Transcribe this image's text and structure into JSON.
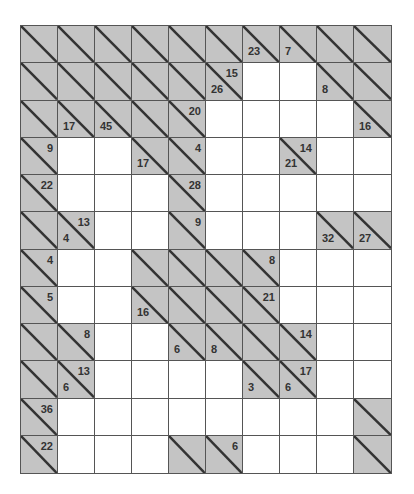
{
  "puzzle": {
    "type": "kakuro",
    "cols": 10,
    "rows": 12,
    "colors": {
      "block": "#c4c4c4",
      "white": "#ffffff",
      "line": "#555555",
      "text": "#333333"
    },
    "grid": [
      [
        {
          "t": "b"
        },
        {
          "t": "b"
        },
        {
          "t": "b"
        },
        {
          "t": "b"
        },
        {
          "t": "b"
        },
        {
          "t": "b"
        },
        {
          "t": "c",
          "d": "23"
        },
        {
          "t": "c",
          "d": "7"
        },
        {
          "t": "b"
        },
        {
          "t": "b"
        }
      ],
      [
        {
          "t": "b"
        },
        {
          "t": "b"
        },
        {
          "t": "b"
        },
        {
          "t": "b"
        },
        {
          "t": "b"
        },
        {
          "t": "c",
          "d": "26",
          "a": "15"
        },
        {
          "t": "w"
        },
        {
          "t": "w"
        },
        {
          "t": "c",
          "d": "8"
        },
        {
          "t": "b"
        }
      ],
      [
        {
          "t": "b"
        },
        {
          "t": "c",
          "d": "17"
        },
        {
          "t": "c",
          "d": "45"
        },
        {
          "t": "b"
        },
        {
          "t": "c",
          "a": "20"
        },
        {
          "t": "w"
        },
        {
          "t": "w"
        },
        {
          "t": "w"
        },
        {
          "t": "w"
        },
        {
          "t": "c",
          "d": "16"
        }
      ],
      [
        {
          "t": "c",
          "a": "9"
        },
        {
          "t": "w"
        },
        {
          "t": "w"
        },
        {
          "t": "c",
          "d": "17"
        },
        {
          "t": "c",
          "a": "4"
        },
        {
          "t": "w"
        },
        {
          "t": "w"
        },
        {
          "t": "c",
          "d": "21",
          "a": "14"
        },
        {
          "t": "w"
        },
        {
          "t": "w"
        }
      ],
      [
        {
          "t": "c",
          "a": "22"
        },
        {
          "t": "w"
        },
        {
          "t": "w"
        },
        {
          "t": "w"
        },
        {
          "t": "c",
          "a": "28"
        },
        {
          "t": "w"
        },
        {
          "t": "w"
        },
        {
          "t": "w"
        },
        {
          "t": "w"
        },
        {
          "t": "w"
        }
      ],
      [
        {
          "t": "b"
        },
        {
          "t": "c",
          "d": "4",
          "a": "13"
        },
        {
          "t": "w"
        },
        {
          "t": "w"
        },
        {
          "t": "c",
          "a": "9"
        },
        {
          "t": "w"
        },
        {
          "t": "w"
        },
        {
          "t": "w"
        },
        {
          "t": "c",
          "d": "32"
        },
        {
          "t": "c",
          "d": "27"
        }
      ],
      [
        {
          "t": "c",
          "a": "4"
        },
        {
          "t": "w"
        },
        {
          "t": "w"
        },
        {
          "t": "b"
        },
        {
          "t": "b"
        },
        {
          "t": "b"
        },
        {
          "t": "c",
          "a": "8"
        },
        {
          "t": "w"
        },
        {
          "t": "w"
        },
        {
          "t": "w"
        }
      ],
      [
        {
          "t": "c",
          "a": "5"
        },
        {
          "t": "w"
        },
        {
          "t": "w"
        },
        {
          "t": "c",
          "d": "16"
        },
        {
          "t": "b"
        },
        {
          "t": "b"
        },
        {
          "t": "c",
          "a": "21"
        },
        {
          "t": "w"
        },
        {
          "t": "w"
        },
        {
          "t": "w"
        }
      ],
      [
        {
          "t": "b"
        },
        {
          "t": "c",
          "a": "8"
        },
        {
          "t": "w"
        },
        {
          "t": "w"
        },
        {
          "t": "c",
          "d": "6"
        },
        {
          "t": "c",
          "d": "8"
        },
        {
          "t": "b"
        },
        {
          "t": "c",
          "a": "14"
        },
        {
          "t": "w"
        },
        {
          "t": "w"
        }
      ],
      [
        {
          "t": "b"
        },
        {
          "t": "c",
          "d": "6",
          "a": "13"
        },
        {
          "t": "w"
        },
        {
          "t": "w"
        },
        {
          "t": "w"
        },
        {
          "t": "w"
        },
        {
          "t": "c",
          "d": "3"
        },
        {
          "t": "c",
          "d": "6",
          "a": "17"
        },
        {
          "t": "w"
        },
        {
          "t": "w"
        }
      ],
      [
        {
          "t": "c",
          "a": "36"
        },
        {
          "t": "w"
        },
        {
          "t": "w"
        },
        {
          "t": "w"
        },
        {
          "t": "w"
        },
        {
          "t": "w"
        },
        {
          "t": "w"
        },
        {
          "t": "w"
        },
        {
          "t": "w"
        },
        {
          "t": "b"
        }
      ],
      [
        {
          "t": "c",
          "a": "22"
        },
        {
          "t": "w"
        },
        {
          "t": "w"
        },
        {
          "t": "w"
        },
        {
          "t": "b"
        },
        {
          "t": "c",
          "a": "6"
        },
        {
          "t": "w"
        },
        {
          "t": "w"
        },
        {
          "t": "w"
        },
        {
          "t": "b"
        }
      ]
    ]
  }
}
